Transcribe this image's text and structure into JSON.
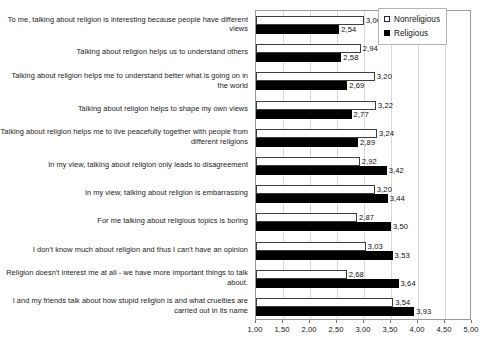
{
  "chart_data": {
    "type": "bar",
    "orientation": "horizontal",
    "title": "",
    "xlabel": "",
    "ylabel": "",
    "xlim": [
      1.0,
      5.0
    ],
    "grid": true,
    "legend_position": "top-right",
    "decimal_separator": ",",
    "tick_labels": [
      "1,00",
      "1,50",
      "2,00",
      "2,50",
      "3,00",
      "3,50",
      "4,00",
      "4,50",
      "5,00"
    ],
    "ticks": [
      1.0,
      1.5,
      2.0,
      2.5,
      3.0,
      3.5,
      4.0,
      4.5,
      5.0
    ],
    "categories": [
      "To me, talking about religion is interesting because people have different views",
      "Talking about religion helps us to understand others",
      "Talking about religion helps me to understand better what is going on in the world",
      "Talking about religion helps to shape my own views",
      "Talking about religion helps me to live peacefully together with people from different religions",
      "In my view, talking about religion only leads to disagreement",
      "In my view, talking about religion is embarrassing",
      "For me talking about religious topics is boring",
      "I don't know much about religion and thus I can't have an opinion",
      "Religion doesn't interest me at all - we have more important things to talk about.",
      "I and my friends talk about how stupid religion is and what cruelties are carried out in its name"
    ],
    "series": [
      {
        "name": "Nonreligious",
        "color": "#ffffff",
        "edge_color": "#3d3d3d",
        "values": [
          3.0,
          2.94,
          3.2,
          3.22,
          3.24,
          2.92,
          3.2,
          2.87,
          3.03,
          2.68,
          3.54
        ],
        "value_labels": [
          "3,00",
          "2,94",
          "3,20",
          "3,22",
          "3,24",
          "2,92",
          "3,20",
          "2,87",
          "3,03",
          "2,68",
          "3,54"
        ]
      },
      {
        "name": "Religious",
        "color": "#000000",
        "edge_color": "#000000",
        "values": [
          2.54,
          2.58,
          2.69,
          2.77,
          2.89,
          3.42,
          3.44,
          3.5,
          3.53,
          3.64,
          3.93
        ],
        "value_labels": [
          "2,54",
          "2,58",
          "2,69",
          "2,77",
          "2,89",
          "3,42",
          "3,44",
          "3,50",
          "3,53",
          "3,64",
          "3,93"
        ]
      }
    ]
  },
  "legend": {
    "items": [
      {
        "label": "Nonreligious",
        "swatch": "hollow-square-icon"
      },
      {
        "label": "Religious",
        "swatch": "filled-square-icon"
      }
    ]
  }
}
